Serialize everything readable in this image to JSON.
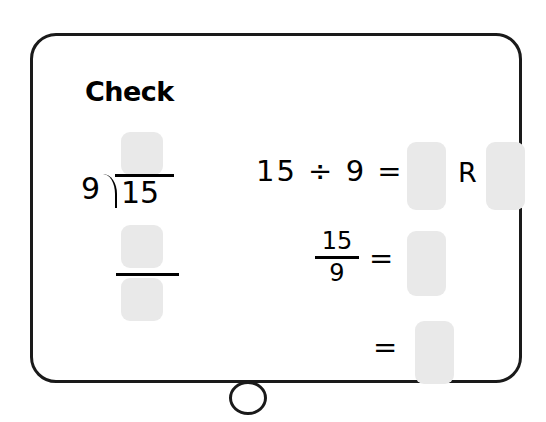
{
  "panel": {
    "title": "Check",
    "frame_border_color": "#1a1a1a",
    "background_color": "#ffffff",
    "answer_box_color": "#e9e9e9"
  },
  "long_division": {
    "divisor": "9",
    "dividend": "15",
    "quotient_box_value": "",
    "subtract_box_value": "",
    "remainder_box_value": ""
  },
  "equations": {
    "row1": {
      "expression": "15 ÷ 9 =",
      "quotient_box_value": "",
      "remainder_label": "R",
      "remainder_box_value": ""
    },
    "row2": {
      "numerator": "15",
      "denominator": "9",
      "equals": "=",
      "answer_box_value": ""
    },
    "row3": {
      "equals": "=",
      "answer_box_value": ""
    }
  },
  "home_button": {
    "label": ""
  }
}
